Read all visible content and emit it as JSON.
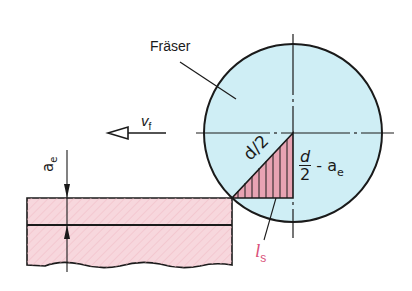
{
  "diagram": {
    "labels": {
      "cutter": "Fräser",
      "feed_velocity": "v",
      "feed_velocity_sub": "f",
      "radius": "d/2",
      "fraction_num": "d",
      "fraction_den": "2",
      "fraction_suffix": "- a",
      "fraction_suffix_sub": "e",
      "depth": "a",
      "depth_sub": "e",
      "contact_length": "l",
      "contact_length_sub": "s"
    },
    "colors": {
      "cutter_fill": "#cfeef5",
      "workpiece_fill": "#f7d7dd",
      "triangle_fill": "#e8a3b3",
      "contact_label": "#d9507a",
      "line": "#1a1a1a"
    }
  }
}
